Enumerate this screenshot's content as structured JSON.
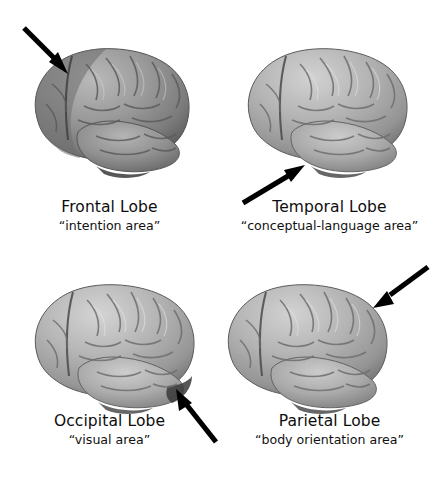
{
  "figure": {
    "background_color": "#ffffff",
    "ink_color": "#111111",
    "layout": "2x2 grid of lateral brain illustrations with arrows and captions"
  },
  "panels": [
    {
      "id": "frontal",
      "title": "Frontal Lobe",
      "subtitle": "“intention area”",
      "image_name": "brain-lateral-view",
      "arrow_name": "arrow-pointing-to-frontal-lobe",
      "arrow_direction": "down-right",
      "arrow_target": "anterior superior cortex (upper left of brain)",
      "highlight": "frontal region shaded darker"
    },
    {
      "id": "temporal",
      "title": "Temporal Lobe",
      "subtitle": "“conceptual-language area”",
      "image_name": "brain-lateral-view",
      "arrow_name": "arrow-pointing-to-temporal-lobe",
      "arrow_direction": "up-right",
      "arrow_target": "inferior lateral cortex (lower middle of brain)",
      "highlight": "none"
    },
    {
      "id": "occipital",
      "title": "Occipital Lobe",
      "subtitle": "“visual area”",
      "image_name": "brain-lateral-view",
      "arrow_name": "arrow-pointing-to-occipital-lobe",
      "arrow_direction": "up-left",
      "arrow_target": "posterior inferior cortex (lower right of brain)",
      "highlight": "none"
    },
    {
      "id": "parietal",
      "title": "Parietal Lobe",
      "subtitle": "“body orientation area”",
      "image_name": "brain-lateral-view",
      "arrow_name": "arrow-pointing-to-parietal-lobe",
      "arrow_direction": "down-left",
      "arrow_target": "posterior superior cortex (upper right of brain)",
      "highlight": "none"
    }
  ],
  "colors": {
    "arrow": "#000000",
    "brain_light": "#c9c9c9",
    "brain_mid": "#a3a3a3",
    "brain_dark": "#6f6f6f",
    "brain_shadow": "#4a4a4a",
    "brain_dark_panel_light": "#a8a8a8",
    "brain_dark_panel_mid": "#828282",
    "brain_dark_panel_dark": "#585858",
    "sulcus": "#5a5a5a",
    "text": "#111111"
  }
}
